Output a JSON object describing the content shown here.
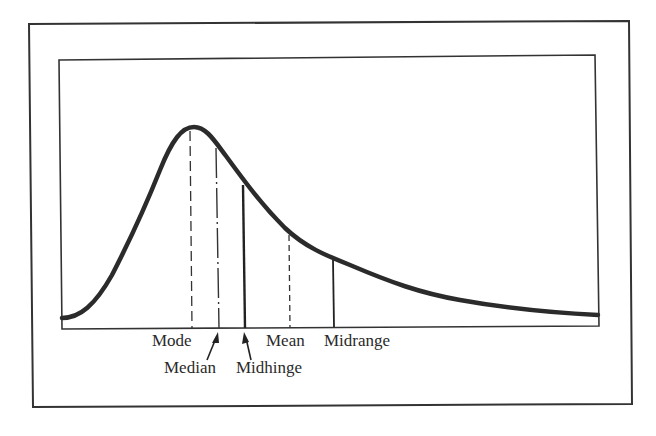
{
  "figure": {
    "curve_color": "#2b2b2b",
    "frame_color": "#333333",
    "measures": [
      {
        "name": "Mode",
        "line_style": "long-dash",
        "order": 1
      },
      {
        "name": "Median",
        "line_style": "dash-dot",
        "order": 2,
        "arrow": true
      },
      {
        "name": "Midhinge",
        "line_style": "solid-thick",
        "order": 3,
        "arrow": true
      },
      {
        "name": "Mean",
        "line_style": "short-dash",
        "order": 4
      },
      {
        "name": "Midrange",
        "line_style": "solid",
        "order": 5
      }
    ]
  },
  "labels": {
    "mode": "Mode",
    "median": "Median",
    "midhinge": "Midhinge",
    "mean": "Mean",
    "midrange": "Midrange"
  }
}
